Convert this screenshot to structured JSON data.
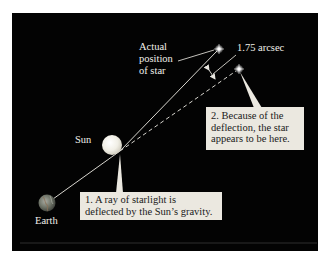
{
  "diagram": {
    "background_color": "#030303",
    "callout_color": "#ebe8e0",
    "labels": {
      "actual_position": [
        "Actual",
        "position",
        "of star"
      ],
      "deflection_angle": "1.75 arcsec",
      "sun": "Sun",
      "earth": "Earth"
    },
    "callouts": [
      {
        "id": "ray-deflected",
        "lines": [
          "1. A ray of starlight is",
          "deflected by the Sun’s gravity."
        ]
      },
      {
        "id": "apparent-position",
        "lines": [
          "2. Because of the",
          "deflection, the star",
          "appears to be here."
        ]
      }
    ],
    "objects": {
      "earth": {
        "cx": 47,
        "cy": 203,
        "r": 8.5
      },
      "sun": {
        "cx": 112,
        "cy": 145,
        "r": 10
      },
      "actual_star": {
        "cx": 219,
        "cy": 49
      },
      "apparent_star": {
        "cx": 239,
        "cy": 69
      },
      "deflection_point": {
        "x": 120,
        "y": 151
      }
    }
  }
}
